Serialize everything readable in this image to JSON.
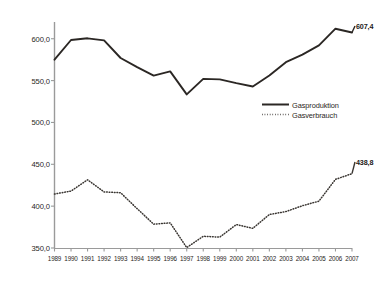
{
  "chart_data": {
    "type": "line",
    "title": "",
    "subtitle": "",
    "xlabel": "",
    "ylabel": "",
    "categories": [
      "1989",
      "1990",
      "1991",
      "1992",
      "1993",
      "1994",
      "1995",
      "1996",
      "1997",
      "1998",
      "1999",
      "2000",
      "2001",
      "2002",
      "2003",
      "2004",
      "2005",
      "2006",
      "2007"
    ],
    "ylim": [
      350.0,
      620.0
    ],
    "yticks": [
      "350,0",
      "400,0",
      "450,0",
      "500,0",
      "550,0",
      "600,0"
    ],
    "ytick_values": [
      350.0,
      400.0,
      450.0,
      500.0,
      550.0,
      600.0
    ],
    "grid": false,
    "legend_position": "middle-right",
    "series": [
      {
        "name": "Gasproduktion",
        "style": "solid",
        "color": "#2b2724",
        "values": [
          575.0,
          598.5,
          600.5,
          598.0,
          577.0,
          566.0,
          556.0,
          561.0,
          533.5,
          552.0,
          551.5,
          547.0,
          543.0,
          556.0,
          572.0,
          581.0,
          592.0,
          612.0,
          607.4
        ],
        "end_label": "607,4"
      },
      {
        "name": "Gasverbrauch",
        "style": "dotted",
        "color": "#3a3632",
        "values": [
          414.5,
          418.0,
          431.5,
          417.0,
          416.0,
          397.0,
          378.5,
          380.0,
          350.5,
          364.0,
          363.0,
          378.0,
          373.5,
          390.0,
          393.5,
          400.5,
          406.0,
          432.0,
          438.8
        ],
        "end_label": "438,8"
      }
    ]
  },
  "legend": {
    "items": [
      {
        "label": "Gasproduktion",
        "style": "solid"
      },
      {
        "label": "Gasverbrauch",
        "style": "dotted"
      }
    ]
  },
  "axes": {
    "x_labels": [
      "1989",
      "1990",
      "1991",
      "1992",
      "1993",
      "1994",
      "1995",
      "1996",
      "1997",
      "1998",
      "1999",
      "2000",
      "2001",
      "2002",
      "2003",
      "2004",
      "2005",
      "2006",
      "2007"
    ],
    "y_labels": [
      "600,0",
      "550,0",
      "500,0",
      "450,0",
      "400,0",
      "350,0"
    ]
  },
  "annotations": {
    "production_end": "607,4",
    "consumption_end": "438,8"
  }
}
